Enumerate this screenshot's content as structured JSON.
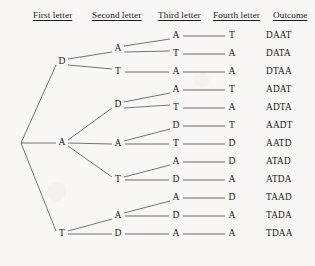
{
  "diagram": {
    "type": "tree",
    "ink_color": "#5d5d5d",
    "text_color": "#1b1b1b",
    "background_color": "#f8f7f5",
    "headers": [
      {
        "label": "First letter",
        "x": 33
      },
      {
        "label": "Second letter",
        "x": 92
      },
      {
        "label": "Third letter",
        "x": 158
      },
      {
        "label": "Fourth letter",
        "x": 213
      },
      {
        "label": "Outcome",
        "x": 273
      }
    ],
    "columns_x": {
      "root": 21,
      "first": 62,
      "second": 118,
      "third": 176,
      "fourth": 232,
      "outcome": 266
    },
    "rows": [
      {
        "first": "D",
        "second": "A",
        "third": "A",
        "fourth": "T",
        "outcome": "DAAT",
        "y": 36,
        "third_y": 36,
        "fourth_y": 36
      },
      {
        "first": "D",
        "second": "A",
        "third": "T",
        "fourth": "A",
        "outcome": "DATA",
        "y": 54,
        "third_y": 54,
        "fourth_y": 54
      },
      {
        "first": "D",
        "second": "T",
        "third": "A",
        "fourth": "A",
        "outcome": "DTAA",
        "y": 72,
        "third_y": 72,
        "fourth_y": 72
      },
      {
        "first": "A",
        "second": "D",
        "third": "A",
        "fourth": "T",
        "outcome": "ADAT",
        "y": 90,
        "third_y": 90,
        "fourth_y": 90
      },
      {
        "first": "A",
        "second": "D",
        "third": "T",
        "fourth": "A",
        "outcome": "ADTA",
        "y": 108,
        "third_y": 108,
        "fourth_y": 108
      },
      {
        "first": "A",
        "second": "A",
        "third": "D",
        "fourth": "T",
        "outcome": "AADT",
        "y": 126,
        "third_y": 126,
        "fourth_y": 126
      },
      {
        "first": "A",
        "second": "A",
        "third": "T",
        "fourth": "D",
        "outcome": "AATD",
        "y": 144,
        "third_y": 144,
        "fourth_y": 144
      },
      {
        "first": "A",
        "second": "T",
        "third": "A",
        "fourth": "D",
        "outcome": "ATAD",
        "y": 162,
        "third_y": 162,
        "fourth_y": 162
      },
      {
        "first": "A",
        "second": "T",
        "third": "D",
        "fourth": "A",
        "outcome": "ATDA",
        "y": 180,
        "third_y": 180,
        "fourth_y": 180
      },
      {
        "first": "T",
        "second": "A",
        "third": "A",
        "fourth": "D",
        "outcome": "TAAD",
        "y": 198,
        "third_y": 198,
        "fourth_y": 198
      },
      {
        "first": "T",
        "second": "A",
        "third": "D",
        "fourth": "A",
        "outcome": "TADA",
        "y": 216,
        "third_y": 216,
        "fourth_y": 216
      },
      {
        "first": "T",
        "second": "D",
        "third": "A",
        "fourth": "A",
        "outcome": "TDAA",
        "y": 234,
        "third_y": 234,
        "fourth_y": 234
      }
    ],
    "first_level_nodes": [
      {
        "label": "D",
        "y": 62
      },
      {
        "label": "A",
        "y": 143
      },
      {
        "label": "T",
        "y": 234
      }
    ],
    "second_level_nodes": [
      {
        "label": "A",
        "y": 49,
        "parent_y": 62
      },
      {
        "label": "T",
        "y": 72,
        "parent_y": 62
      },
      {
        "label": "D",
        "y": 105,
        "parent_y": 143
      },
      {
        "label": "A",
        "y": 144,
        "parent_y": 143
      },
      {
        "label": "T",
        "y": 180,
        "parent_y": 143
      },
      {
        "label": "A",
        "y": 216,
        "parent_y": 234
      },
      {
        "label": "D",
        "y": 234,
        "parent_y": 234
      }
    ],
    "root_y": 143,
    "outcomes_list": [
      "DAAT",
      "DATA",
      "DTAA",
      "ADAT",
      "ADTA",
      "AADT",
      "AATD",
      "ATAD",
      "ATDA",
      "TAAD",
      "TADA",
      "TDAA"
    ],
    "outcome_count": 12
  }
}
